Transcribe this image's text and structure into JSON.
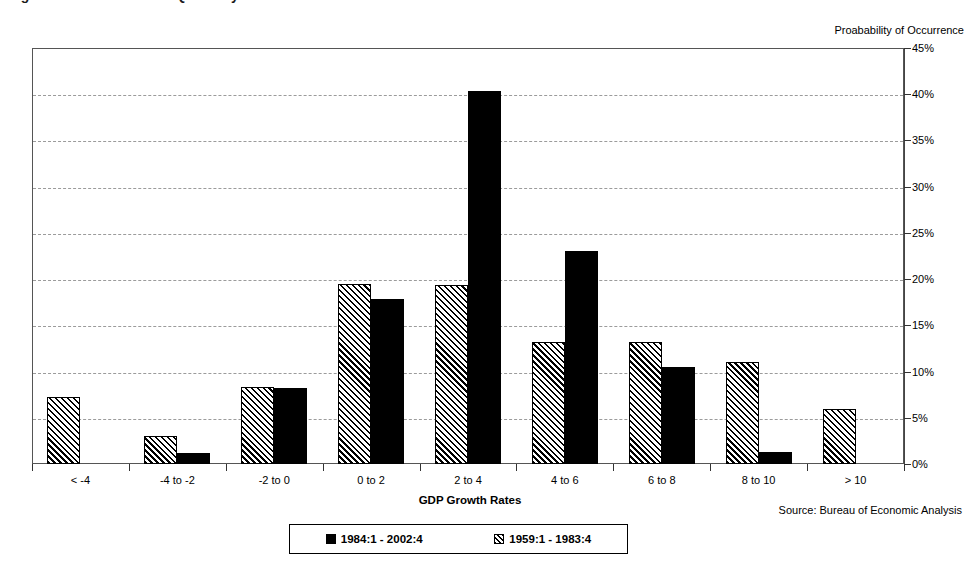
{
  "chart_data": {
    "type": "bar",
    "title": "Figure 1.  Distribution of Quarterly Real GDP Growth Rates",
    "xlabel": "GDP Growth Rates",
    "ylabel": "Proabability of Occurrence",
    "ylim": [
      0,
      45
    ],
    "ytick_step": 5,
    "ytick_labels": [
      "0%",
      "5%",
      "10%",
      "15%",
      "20%",
      "25%",
      "30%",
      "35%",
      "40%",
      "45%"
    ],
    "ytick_values": [
      0,
      5,
      10,
      15,
      20,
      25,
      30,
      35,
      40,
      45
    ],
    "grid": true,
    "grid_style": "dashed-horizontal",
    "legend_position": "bottom-center",
    "categories": [
      "< -4",
      "-4 to -2",
      "-2 to 0",
      "0 to 2",
      "2 to 4",
      "4 to 6",
      "6 to 8",
      "8 to 10",
      "> 10"
    ],
    "series": [
      {
        "name": "1984:1 - 2002:4",
        "pattern": "solid",
        "color": "#000000",
        "values": [
          0,
          1.2,
          8.2,
          17.8,
          40.4,
          23.0,
          10.5,
          1.3,
          0
        ]
      },
      {
        "name": "1959:1 - 1983:4",
        "pattern": "hatch",
        "color": "#000000",
        "values": [
          7.2,
          3.0,
          8.3,
          19.5,
          19.4,
          13.2,
          13.2,
          11.0,
          6.0
        ]
      }
    ],
    "source_note": "Source: Bureau of Economic Analysis"
  },
  "legend": {
    "entries": [
      {
        "label": "1984:1 - 2002:4",
        "pattern": "solid"
      },
      {
        "label": "1959:1 - 1983:4",
        "pattern": "hatch"
      }
    ]
  }
}
